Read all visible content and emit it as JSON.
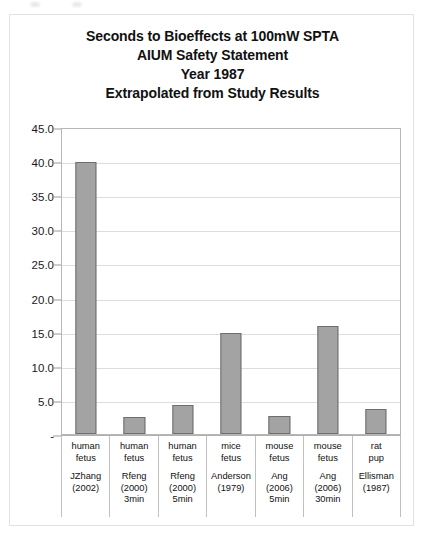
{
  "chart_data": {
    "type": "bar",
    "title": "Seconds to Bioeffects at 100mW SPTA\nAIUM Safety Statement\nYear 1987\nExtrapolated from Study Results",
    "title_lines": [
      "Seconds to Bioeffects at 100mW SPTA",
      "AIUM Safety Statement",
      "Year 1987",
      "Extrapolated from Study Results"
    ],
    "xlabel": "",
    "ylabel": "",
    "ylim": [
      0,
      45
    ],
    "ytick_values": [
      45,
      40,
      35,
      30,
      25,
      20,
      15,
      10,
      5,
      0
    ],
    "ytick_labels": [
      "45.0",
      "40.0",
      "35.0",
      "30.0",
      "25.0",
      "20.0",
      "15.0",
      "10.0",
      "5.0",
      "-"
    ],
    "grid": true,
    "legend": false,
    "categories": [
      "human fetus",
      "human fetus",
      "human fetus",
      "mice fetus",
      "mouse fetus",
      "mouse fetus",
      "rat pup"
    ],
    "category_sources": [
      "JZhang\n(2002)",
      "Rfeng\n(2000)\n3min",
      "Rfeng\n(2000)\n5min",
      "Anderson\n(1979)",
      "Ang\n(2006)\n5min",
      "Ang\n(2006)\n30min",
      "Ellisman\n(1987)"
    ],
    "values": [
      39.8,
      2.5,
      4.2,
      14.8,
      2.7,
      15.8,
      3.7
    ],
    "bar_fill_color": "#a3a3a3",
    "bar_border_color": "#6e6e6e",
    "gridline_color": "#dddddd",
    "plot_border_color": "#b6b6b6",
    "background_color": "#ffffff"
  }
}
